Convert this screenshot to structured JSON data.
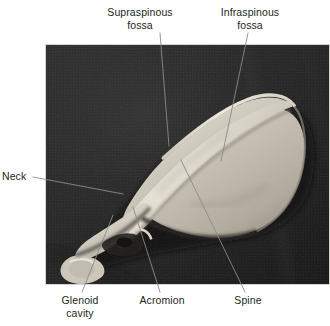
{
  "figure": {
    "kind": "anatomical-photograph",
    "view": "lateral-oblique",
    "background_color": "#ffffff",
    "photo": {
      "backdrop_color": "#232323",
      "bone_color": "#cfcac0",
      "border_color": "#d5d3cd",
      "x": 45,
      "y": 44,
      "width": 285,
      "height": 241
    },
    "leader_line_color": "#8a8a8a"
  },
  "labels": [
    {
      "id": "supraspinous-fossa",
      "text": "Supraspinous\nfossa",
      "align": "center",
      "leader": {
        "x1": 160,
        "y1": 33,
        "x2": 169,
        "y2": 146
      }
    },
    {
      "id": "infraspinous-fossa",
      "text": "Infraspinous\nfossa",
      "align": "center",
      "leader": {
        "x1": 248,
        "y1": 33,
        "x2": 221,
        "y2": 161
      }
    },
    {
      "id": "neck",
      "text": "Neck",
      "align": "left",
      "leader": {
        "x1": 33,
        "y1": 177,
        "x2": 123,
        "y2": 194
      }
    },
    {
      "id": "glenoid-cavity",
      "text": "Glenoid\ncavity",
      "align": "center",
      "leader": {
        "x1": 82,
        "y1": 292,
        "x2": 113,
        "y2": 215
      }
    },
    {
      "id": "acromion",
      "text": "Acromion",
      "align": "center",
      "leader": {
        "x1": 160,
        "y1": 292,
        "x2": 133,
        "y2": 207
      }
    },
    {
      "id": "spine",
      "text": "Spine",
      "align": "center",
      "leader": {
        "x1": 245,
        "y1": 292,
        "x2": 181,
        "y2": 160
      }
    }
  ]
}
